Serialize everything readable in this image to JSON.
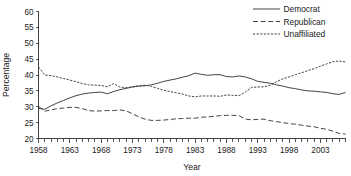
{
  "chart_data": {
    "type": "line",
    "title": "",
    "xlabel": "Year",
    "ylabel": "Percentage",
    "xlim": [
      1958,
      2007
    ],
    "ylim": [
      20,
      60
    ],
    "yticks": [
      20,
      25,
      30,
      35,
      40,
      45,
      50,
      55,
      60
    ],
    "ytick_labels": [
      "20",
      "25",
      "30",
      "35",
      "40",
      "45",
      "50",
      "55",
      "60"
    ],
    "xticks_labeled": [
      1958,
      1963,
      1968,
      1973,
      1978,
      1983,
      1988,
      1993,
      1998,
      2003
    ],
    "xtick_labels": [
      "1958",
      "1963",
      "1968",
      "1973",
      "1978",
      "1983",
      "1988",
      "1993",
      "1998",
      "2003"
    ],
    "xtick_minor_step": 1,
    "grid": false,
    "legend_position": "top-right",
    "x": [
      1958,
      1959,
      1960,
      1961,
      1962,
      1963,
      1964,
      1965,
      1966,
      1967,
      1968,
      1969,
      1970,
      1971,
      1972,
      1973,
      1974,
      1975,
      1976,
      1977,
      1978,
      1979,
      1980,
      1981,
      1982,
      1983,
      1984,
      1985,
      1986,
      1987,
      1988,
      1989,
      1990,
      1991,
      1992,
      1993,
      1994,
      1995,
      1996,
      1997,
      1998,
      1999,
      2000,
      2001,
      2002,
      2003,
      2004,
      2005,
      2006,
      2007
    ],
    "series": [
      {
        "name": "Democrat",
        "linestyle": "solid",
        "color": "#3a3a3a",
        "values": [
          29.5,
          29.2,
          30.3,
          31.2,
          32.0,
          32.8,
          33.5,
          34.0,
          34.3,
          34.5,
          34.6,
          34.1,
          34.8,
          35.4,
          35.8,
          36.2,
          36.5,
          36.6,
          36.9,
          37.4,
          38.0,
          38.4,
          38.8,
          39.3,
          39.8,
          40.6,
          40.2,
          39.9,
          40.1,
          40.1,
          39.5,
          39.4,
          39.7,
          39.4,
          38.8,
          38.0,
          37.7,
          37.4,
          36.9,
          36.5,
          36.0,
          35.7,
          35.3,
          35.0,
          34.9,
          34.7,
          34.5,
          34.1,
          33.9,
          34.5
        ]
      },
      {
        "name": "Republican",
        "linestyle": "dashed",
        "color": "#3a3a3a",
        "values": [
          30.1,
          28.6,
          29.0,
          29.4,
          29.6,
          29.8,
          29.8,
          29.4,
          28.8,
          28.6,
          28.7,
          28.8,
          28.8,
          29.0,
          28.7,
          27.8,
          26.8,
          26.1,
          25.7,
          25.7,
          25.8,
          26.0,
          26.2,
          26.3,
          26.4,
          26.4,
          26.7,
          26.8,
          27.0,
          27.2,
          27.3,
          27.3,
          27.2,
          26.1,
          25.9,
          26.0,
          26.1,
          25.6,
          25.3,
          25.0,
          24.7,
          24.5,
          24.2,
          23.9,
          23.7,
          23.2,
          22.9,
          22.3,
          21.6,
          21.4
        ]
      },
      {
        "name": "Unaffiliated",
        "linestyle": "dotted",
        "color": "#3a3a3a",
        "values": [
          42.5,
          40.0,
          39.8,
          39.4,
          38.9,
          38.4,
          37.9,
          37.3,
          36.9,
          36.8,
          36.7,
          36.3,
          37.3,
          36.2,
          36.0,
          36.3,
          36.6,
          36.8,
          36.4,
          35.8,
          35.2,
          34.8,
          34.4,
          34.0,
          33.4,
          33.1,
          33.4,
          33.4,
          33.4,
          33.3,
          33.7,
          33.6,
          33.5,
          34.6,
          36.1,
          36.2,
          36.3,
          36.8,
          37.9,
          38.8,
          39.4,
          40.1,
          40.7,
          41.4,
          42.0,
          42.8,
          43.5,
          44.2,
          44.4,
          44.1
        ]
      }
    ]
  },
  "legend": {
    "items": [
      {
        "label": "Democrat"
      },
      {
        "label": "Republican"
      },
      {
        "label": "Unaffiliated"
      }
    ]
  },
  "axes": {
    "x_title": "Year",
    "y_title": "Percentage"
  }
}
